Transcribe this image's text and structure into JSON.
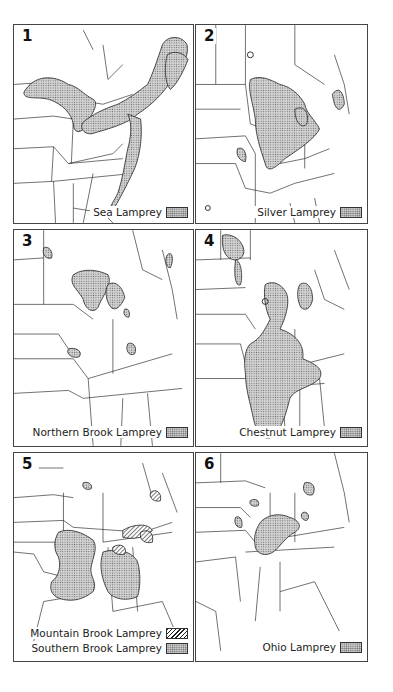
{
  "figure": {
    "type": "range-maps",
    "region": "Eastern United States",
    "panels": [
      {
        "number": "1",
        "legend": [
          {
            "label": "Sea Lamprey",
            "pattern": "stipple"
          }
        ]
      },
      {
        "number": "2",
        "legend": [
          {
            "label": "Silver Lamprey",
            "pattern": "stipple"
          }
        ]
      },
      {
        "number": "3",
        "legend": [
          {
            "label": "Northern Brook Lamprey",
            "pattern": "stipple"
          }
        ]
      },
      {
        "number": "4",
        "legend": [
          {
            "label": "Chestnut Lamprey",
            "pattern": "stipple"
          }
        ]
      },
      {
        "number": "5",
        "legend": [
          {
            "label": "Mountain Brook Lamprey",
            "pattern": "hatch"
          },
          {
            "label": "Southern Brook Lamprey",
            "pattern": "stipple"
          }
        ]
      },
      {
        "number": "6",
        "legend": [
          {
            "label": "Ohio Lamprey",
            "pattern": "stipple"
          }
        ]
      }
    ]
  },
  "colors": {
    "border": "#444444",
    "range_fill": "#b8b8b8",
    "lines": "#333333",
    "background": "#ffffff"
  }
}
